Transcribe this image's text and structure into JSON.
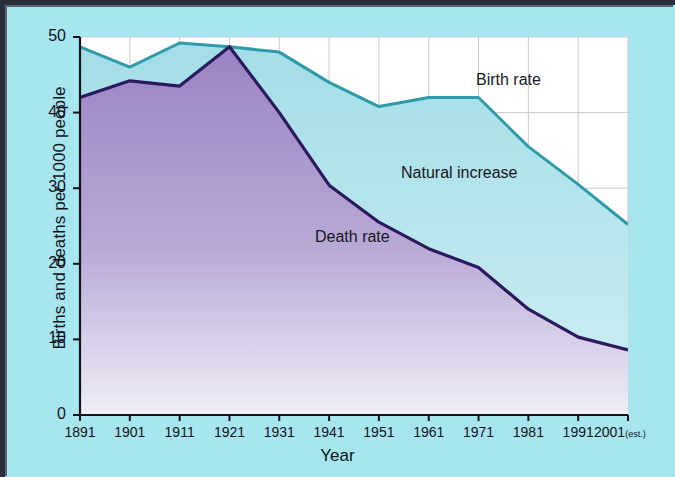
{
  "chart_data": {
    "type": "area",
    "title": "",
    "xlabel": "Year",
    "ylabel": "Births and deaths per 1000 people",
    "x": [
      1891,
      1901,
      1911,
      1921,
      1931,
      1941,
      1951,
      1961,
      1971,
      1981,
      1991,
      2001
    ],
    "xtick_labels": [
      "1891",
      "1901",
      "1911",
      "1921",
      "1931",
      "1941",
      "1951",
      "1961",
      "1971",
      "1981",
      "1991",
      "2001"
    ],
    "xtick_last_suffix": "(est.)",
    "ytick_labels": [
      "0",
      "10",
      "20",
      "30",
      "40",
      "50"
    ],
    "ytick_values": [
      0,
      10,
      20,
      30,
      40,
      50
    ],
    "xlim": [
      1891,
      2001
    ],
    "ylim": [
      0,
      50
    ],
    "grid": true,
    "legend_position": "inline-annotations",
    "series": [
      {
        "name": "Birth rate",
        "color": "#2f9aa8",
        "fill_top": "#a9dfe8",
        "fill_bottom": "#bfe8ee",
        "values": [
          48.7,
          46.0,
          49.2,
          48.7,
          48.0,
          44.0,
          40.8,
          42.0,
          42.0,
          35.5,
          30.5,
          25.2
        ]
      },
      {
        "name": "Death rate",
        "color": "#2b1b5e",
        "fill_top": "#9c86c4",
        "fill_bottom": "#ece9f6",
        "values": [
          42.0,
          44.2,
          43.5,
          48.7,
          40.0,
          30.4,
          25.5,
          22.0,
          19.5,
          14.0,
          10.3,
          8.6
        ]
      }
    ],
    "annotations": [
      {
        "text": "Birth rate",
        "x_px": 476,
        "y_px": 71
      },
      {
        "text": "Natural increase",
        "x_px": 401,
        "y_px": 164
      },
      {
        "text": "Death rate",
        "x_px": 315,
        "y_px": 228
      }
    ],
    "band_name": "Natural increase",
    "band_description": "Shaded area between the birth rate and death rate curves"
  },
  "figure": {
    "background_color": "#a8e6ef",
    "plot_background_color": "#ffffff",
    "frame_color": "#2b2f3a",
    "gridline_color": "#c9c9d2",
    "axis_color": "#111319"
  }
}
